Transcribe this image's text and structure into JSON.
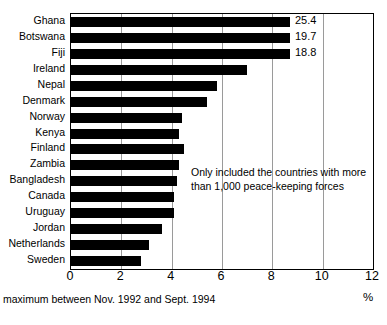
{
  "chart_data": {
    "type": "bar",
    "orientation": "horizontal",
    "title": "",
    "xlabel": "%",
    "ylabel": "",
    "xlim": [
      0,
      12
    ],
    "xticks": [
      0,
      2,
      4,
      6,
      8,
      10,
      12
    ],
    "grid": true,
    "legend": null,
    "categories": [
      "Ghana",
      "Botswana",
      "Fiji",
      "Ireland",
      "Nepal",
      "Denmark",
      "Norway",
      "Kenya",
      "Finland",
      "Zambia",
      "Bangladesh",
      "Canada",
      "Uruguay",
      "Jordan",
      "Netherlands",
      "Sweden"
    ],
    "values": [
      25.4,
      19.7,
      18.8,
      7.0,
      5.8,
      5.4,
      4.4,
      4.3,
      4.5,
      4.3,
      4.2,
      4.1,
      4.1,
      3.6,
      3.1,
      2.8
    ],
    "value_labels": [
      "25.4",
      "19.7",
      "18.8",
      "",
      "",
      "",
      "",
      "",
      "",
      "",
      "",
      "",
      "",
      "",
      "",
      ""
    ],
    "clipped_axis_max": 12,
    "annotation": {
      "line1": "Only included the countries with more",
      "line2": "than 1,000 peace-keeping forces"
    },
    "footnote": "maximum between Nov. 1992 and Sept. 1994",
    "colors": {
      "bar": "#000000",
      "grid": "#9a9a9a",
      "frame": "#000000",
      "text": "#000000",
      "background": "#ffffff"
    }
  }
}
